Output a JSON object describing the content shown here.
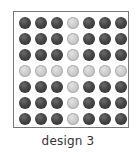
{
  "caption": "design 3",
  "grid": {
    "rows": 7,
    "cols": 7,
    "colors": {
      "dark": "#3a3a3a",
      "light": "#c8c8c8"
    },
    "cells": [
      [
        "dark",
        "dark",
        "dark",
        "light",
        "dark",
        "dark",
        "dark"
      ],
      [
        "dark",
        "dark",
        "dark",
        "light",
        "dark",
        "dark",
        "dark"
      ],
      [
        "dark",
        "dark",
        "dark",
        "light",
        "dark",
        "dark",
        "dark"
      ],
      [
        "light",
        "light",
        "light",
        "light",
        "light",
        "light",
        "light"
      ],
      [
        "dark",
        "dark",
        "dark",
        "light",
        "dark",
        "dark",
        "dark"
      ],
      [
        "dark",
        "dark",
        "dark",
        "light",
        "dark",
        "dark",
        "dark"
      ],
      [
        "dark",
        "dark",
        "dark",
        "light",
        "dark",
        "dark",
        "dark"
      ]
    ]
  }
}
